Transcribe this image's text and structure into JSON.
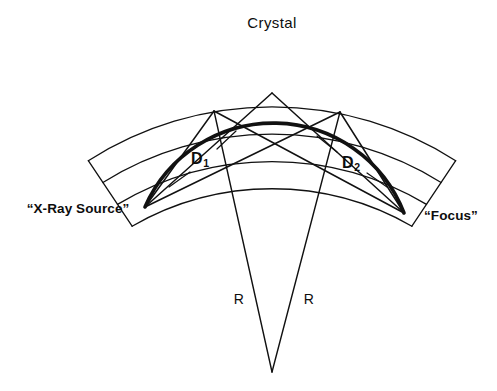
{
  "figure": {
    "title": "Crystal",
    "background_color": "#ffffff",
    "ink_color": "#111111",
    "width": 497,
    "height": 391
  },
  "labels": {
    "crystal": "Crystal",
    "source": "“X-Ray Source”",
    "focus": "“Focus”",
    "d1_base": "D",
    "d1_sub": "1",
    "d2_base": "D",
    "d2_sub": "2",
    "r_left": "R",
    "r_right": "R"
  },
  "diagram_data": {
    "type": "geometric-optics-diagram",
    "description": "Rowland circle focusing geometry for a curved crystal X-ray spectrometer",
    "rowland_circle": {
      "center": [
        272,
        232
      ],
      "radius": 140,
      "top_point": [
        272,
        92
      ],
      "bottom_point": [
        272,
        372
      ],
      "stroke_width_thin": 1.6,
      "stroke_width_thick": 3.4
    },
    "points": [
      {
        "name": "x-ray-source",
        "label": "“X-Ray Source”",
        "x": 145,
        "y": 207
      },
      {
        "name": "focus",
        "label": "“Focus”",
        "x": 404,
        "y": 213
      },
      {
        "name": "crystal-point-left",
        "label": "",
        "x": 214,
        "y": 111
      },
      {
        "name": "crystal-point-center",
        "label": "",
        "x": 272,
        "y": 92
      },
      {
        "name": "crystal-point-right",
        "label": "",
        "x": 340,
        "y": 112
      },
      {
        "name": "circle-bottom-vertex",
        "label": "",
        "x": 272,
        "y": 372
      }
    ],
    "rays": [
      {
        "from": "x-ray-source",
        "to": "crystal-point-left"
      },
      {
        "from": "x-ray-source",
        "to": "crystal-point-center"
      },
      {
        "from": "x-ray-source",
        "to": "crystal-point-right"
      },
      {
        "from": "crystal-point-left",
        "to": "focus"
      },
      {
        "from": "crystal-point-center",
        "to": "focus"
      },
      {
        "from": "crystal-point-right",
        "to": "focus"
      }
    ],
    "radii": [
      {
        "name": "R-left",
        "label": "R",
        "from": "crystal-point-left",
        "to": "circle-bottom-vertex"
      },
      {
        "name": "R-right",
        "label": "R",
        "from": "crystal-point-right",
        "to": "circle-bottom-vertex"
      }
    ],
    "crystal": {
      "name": "curved-crystal",
      "band_count": 3,
      "arc_line_count": 4,
      "arc_center": [
        272,
        372
      ],
      "arc_radii": [
        280,
        300,
        320,
        340
      ],
      "angular_half_span_deg": 41,
      "stroke_width": 1.3
    },
    "label_positions": {
      "crystal": [
        272,
        22
      ],
      "source": [
        78,
        209
      ],
      "focus": [
        451,
        216
      ],
      "d1": [
        200,
        159
      ],
      "d2": [
        351,
        163
      ],
      "r_left": [
        239,
        299
      ],
      "r_right": [
        309,
        299
      ]
    },
    "leader_lines": [
      {
        "for": "D1",
        "from": [
          216,
          148
        ],
        "to": [
          235,
          132
        ]
      },
      {
        "for": "D1",
        "from": [
          190,
          172
        ],
        "to": [
          170,
          186
        ]
      },
      {
        "for": "D2",
        "from": [
          338,
          152
        ],
        "to": [
          318,
          137
        ]
      },
      {
        "for": "D2",
        "from": [
          366,
          172
        ],
        "to": [
          386,
          186
        ]
      }
    ]
  }
}
